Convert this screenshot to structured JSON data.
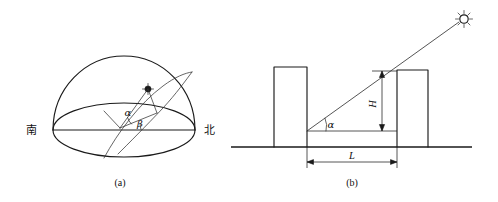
{
  "figure": {
    "panels": [
      {
        "id": "panel-a",
        "caption": "(a)",
        "description": "Celestial hemisphere showing solar path with altitude angle alpha and azimuth angle beta",
        "labels": {
          "south": "南",
          "north": "北",
          "altitude_angle": "α",
          "azimuth_angle": "β"
        },
        "markers": {
          "sun_position": "sun-position-marker"
        }
      },
      {
        "id": "panel-b",
        "caption": "(b)",
        "description": "Side elevation of two buildings with sun ray, shadow length L, height H and solar altitude angle alpha",
        "labels": {
          "height": "H",
          "length": "L",
          "altitude_angle": "α"
        },
        "markers": {
          "sun": "sun-icon"
        }
      }
    ]
  },
  "colors": {
    "ink": "#1a1a1a",
    "thin_ink": "#333333",
    "background": "#ffffff"
  }
}
